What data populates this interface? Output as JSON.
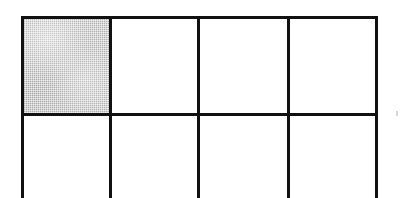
{
  "figure": {
    "kind": "grid-diagram",
    "caption": "",
    "background_color": "#ffffff",
    "line_color": "#111111",
    "line_thickness_px": 3,
    "shaded_fill_color": "#b9b9b9",
    "columns": 4,
    "rows_visible": 2,
    "bottom_row_cropped": true,
    "shaded_cells": [
      "r1c1"
    ],
    "bounds": {
      "left_px": 21,
      "top_px": 16,
      "right_px": 378,
      "width_px": 357,
      "height_px": 182
    },
    "vertical_line_x": [
      21,
      110,
      198,
      288,
      378
    ],
    "horizontal_line_y": [
      16,
      113
    ],
    "cells": [
      {
        "id": "r1c1",
        "row": 1,
        "col": 1,
        "x": 0,
        "y": 0,
        "w": 89,
        "h": 97,
        "shaded": true,
        "label": ""
      },
      {
        "id": "r1c2",
        "row": 1,
        "col": 2,
        "x": 89,
        "y": 0,
        "w": 88,
        "h": 97,
        "shaded": false,
        "label": ""
      },
      {
        "id": "r1c3",
        "row": 1,
        "col": 3,
        "x": 177,
        "y": 0,
        "w": 90,
        "h": 97,
        "shaded": false,
        "label": ""
      },
      {
        "id": "r1c4",
        "row": 1,
        "col": 4,
        "x": 267,
        "y": 0,
        "w": 90,
        "h": 97,
        "shaded": false,
        "label": ""
      },
      {
        "id": "r2c1",
        "row": 2,
        "col": 1,
        "x": 0,
        "y": 97,
        "w": 89,
        "h": 85,
        "shaded": false,
        "label": ""
      },
      {
        "id": "r2c2",
        "row": 2,
        "col": 2,
        "x": 89,
        "y": 97,
        "w": 88,
        "h": 85,
        "shaded": false,
        "label": ""
      },
      {
        "id": "r2c3",
        "row": 2,
        "col": 3,
        "x": 177,
        "y": 97,
        "w": 90,
        "h": 85,
        "shaded": false,
        "label": ""
      },
      {
        "id": "r2c4",
        "row": 2,
        "col": 4,
        "x": 267,
        "y": 97,
        "w": 90,
        "h": 85,
        "shaded": false,
        "label": ""
      }
    ],
    "artifacts": [
      {
        "name": "scan-speck",
        "x": 396,
        "y": 111
      }
    ]
  }
}
